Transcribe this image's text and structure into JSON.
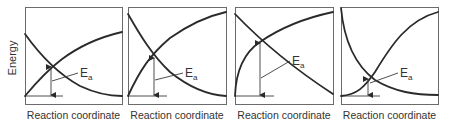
{
  "figure": {
    "y_axis_label": "Energy",
    "x_axis_label": "Reaction coordinate",
    "ea_label_main": "E",
    "ea_label_sub": "a",
    "colors": {
      "curve": "#2a2a2a",
      "frame": "#6b6b6b",
      "text": "#333333"
    }
  },
  "panels": [
    {
      "id": 1,
      "box": [
        25,
        7,
        97,
        97
      ],
      "xlabel": "Reaction coordinate",
      "rising_curve": "M25,96 C45,72 70,44 122,32",
      "falling_curve": "M25,34 C40,55 60,75 80,86 C95,93 110,96 122,96",
      "crossing": [
        51,
        66
      ],
      "baseline": [
        25,
        96,
        63
      ],
      "ea_leader": [
        52,
        81,
        78,
        73
      ],
      "ea_label_pos": [
        80,
        77
      ]
    },
    {
      "id": 2,
      "box": [
        128,
        7,
        98,
        97
      ],
      "xlabel": "Reaction coordinate",
      "rising_curve": "M128,96 C140,70 150,55 170,38 C190,24 208,16 226,12",
      "falling_curve": "M128,14 C140,35 152,55 170,72 C190,88 208,95 226,96",
      "crossing": [
        154,
        57
      ],
      "baseline": [
        128,
        96,
        167
      ],
      "ea_leader": [
        155,
        80,
        183,
        73
      ],
      "ea_label_pos": [
        185,
        77
      ]
    },
    {
      "id": 3,
      "box": [
        235,
        7,
        98,
        97
      ],
      "xlabel": "Reaction coordinate",
      "rising_curve": "M235,96 C236,70 245,52 260,42 C280,28 305,18 333,12",
      "falling_curve": "M235,14 C260,40 290,66 333,94",
      "crossing": [
        260,
        42
      ],
      "baseline": [
        235,
        96,
        274
      ],
      "ea_leader": [
        261,
        78,
        290,
        61
      ],
      "ea_label_pos": [
        292,
        65
      ]
    },
    {
      "id": 4,
      "box": [
        341,
        7,
        97,
        97
      ],
      "xlabel": "Reaction coordinate",
      "rising_curve": "M341,96 C356,95 364,88 375,72 C392,44 408,20 438,12",
      "falling_curve": "M341,8 C344,40 355,65 375,80 C395,92 415,95 438,95",
      "crossing": [
        368,
        78
      ],
      "baseline": [
        341,
        96,
        380
      ],
      "ea_leader": [
        370,
        83,
        398,
        73
      ],
      "ea_label_pos": [
        400,
        77
      ]
    }
  ]
}
